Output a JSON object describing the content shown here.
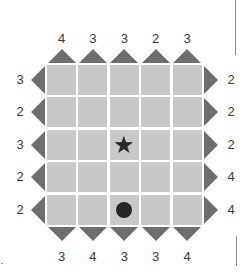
{
  "puzzle": {
    "rows": 5,
    "cols": 5,
    "clues": {
      "top": [
        "4",
        "3",
        "3",
        "2",
        "3"
      ],
      "bottom": [
        "3",
        "4",
        "3",
        "3",
        "4"
      ],
      "left": [
        "3",
        "2",
        "3",
        "2",
        "2"
      ],
      "right": [
        "2",
        "2",
        "2",
        "4",
        "4"
      ]
    },
    "markers": [
      {
        "type": "star-icon",
        "row": 3,
        "col": 3
      },
      {
        "type": "circle-icon",
        "row": 5,
        "col": 3
      }
    ],
    "colors": {
      "cell": "#c9c9c9",
      "arrow": "#6e6e6e",
      "marker": "#262626",
      "clue_text": "#3a3a3a"
    }
  }
}
